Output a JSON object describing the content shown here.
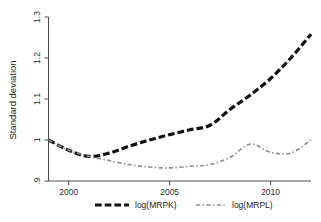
{
  "chart_data": {
    "type": "line",
    "title": "",
    "xlabel": "",
    "ylabel": "Standard deviation",
    "xlim": [
      1999,
      2012
    ],
    "ylim": [
      0.9,
      1.3
    ],
    "grid": false,
    "legend_position": "bottom",
    "xticks": [
      2000,
      2005,
      2010
    ],
    "xticklabels": [
      "2000",
      "2005",
      "2010"
    ],
    "yticks": [
      0.9,
      1.0,
      1.1,
      1.2,
      1.3
    ],
    "yticklabels": [
      ".9",
      "1",
      "1.1",
      "1.2",
      "1.3"
    ],
    "x": [
      1999,
      2000,
      2001,
      2002,
      2003,
      2004,
      2005,
      2006,
      2007,
      2008,
      2009,
      2010,
      2011,
      2012
    ],
    "series": [
      {
        "name": "log(MRPK)",
        "style": "dashed",
        "color": "#111111",
        "width": 3.2,
        "values": [
          1.0,
          0.975,
          0.96,
          0.968,
          0.985,
          1.0,
          1.013,
          1.025,
          1.036,
          1.075,
          1.11,
          1.15,
          1.2,
          1.258
        ]
      },
      {
        "name": "log(MRPL)",
        "style": "dash-dot",
        "color": "#8c8c8c",
        "width": 1.6,
        "values": [
          1.0,
          0.975,
          0.96,
          0.95,
          0.94,
          0.934,
          0.932,
          0.936,
          0.94,
          0.958,
          0.99,
          0.97,
          0.968,
          1.0
        ]
      }
    ]
  },
  "legend": {
    "items": [
      {
        "label": "log(MRPK)",
        "swatch": "dashed-thick-black"
      },
      {
        "label": "log(MRPL)",
        "swatch": "dashdot-thin-gray"
      }
    ]
  },
  "axes": {
    "y_title": "Standard deviation"
  }
}
